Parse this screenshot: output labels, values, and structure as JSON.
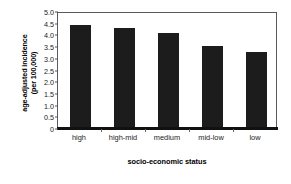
{
  "chart_data": {
    "type": "bar",
    "title": "",
    "categories": [
      "high",
      "high-mid",
      "medium",
      "mid-low",
      "low"
    ],
    "values": [
      4.4,
      4.27,
      4.07,
      3.52,
      3.25
    ],
    "xlabel": "socio-economic status",
    "ylabel_line1": "age-adjusted incidence",
    "ylabel_line2": "(per 100,000)",
    "ylim": [
      0,
      5.0
    ],
    "yticks": [
      "0",
      "0.5",
      "1.0",
      "1.5",
      "2.0",
      "2.5",
      "3.0",
      "3.5",
      "4.0",
      "4.5",
      "5.0"
    ],
    "ytick_values": [
      0,
      0.5,
      1.0,
      1.5,
      2.0,
      2.5,
      3.0,
      3.5,
      4.0,
      4.5,
      5.0
    ],
    "grid": false,
    "legend": false,
    "bar_color": "#1c1c1c",
    "frame_color": "#5a5a5a",
    "background": "#ffffff"
  }
}
